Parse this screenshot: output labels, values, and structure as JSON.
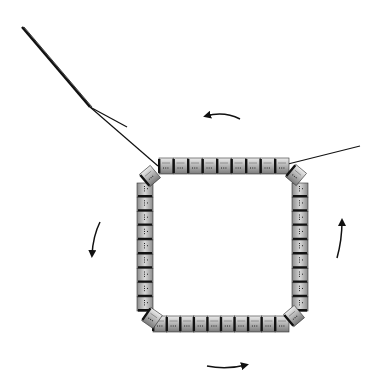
{
  "diagram": {
    "type": "beadwork-stitch-illustration",
    "colors": {
      "background": "#ffffff",
      "thread": "#111111",
      "bead_body": "#a9a9a9",
      "bead_highlight": "#e6e6e6",
      "bead_edge": "#111111",
      "arrow": "#111111"
    },
    "bead_counts": {
      "top": 9,
      "bottom": 10,
      "left": 9,
      "right": 9,
      "corners": 4
    },
    "direction": "counter-clockwise",
    "arrows": [
      {
        "name": "top",
        "points": "left"
      },
      {
        "name": "left",
        "points": "down"
      },
      {
        "name": "bottom",
        "points": "right"
      },
      {
        "name": "right",
        "points": "up"
      }
    ],
    "threads": [
      {
        "name": "needle-thread",
        "from": [
          22,
          27
        ],
        "to": [
          157,
          165
        ]
      },
      {
        "name": "tail-thread",
        "from": [
          90,
          107
        ],
        "to": [
          127,
          127
        ]
      },
      {
        "name": "exit-thread",
        "from": [
          290,
          164
        ],
        "to": [
          360,
          146
        ]
      }
    ]
  }
}
